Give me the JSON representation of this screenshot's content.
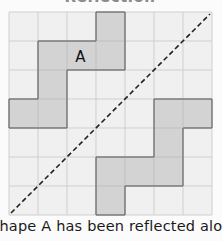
{
  "title": "Reflection",
  "grid": {
    "columns": 7,
    "rows": 7
  },
  "shape_a": {
    "label": "A",
    "cells": [
      [
        3,
        0
      ],
      [
        1,
        1
      ],
      [
        2,
        1
      ],
      [
        3,
        1
      ],
      [
        1,
        2
      ],
      [
        0,
        3
      ],
      [
        1,
        3
      ]
    ],
    "label_cell": [
      2,
      1
    ]
  },
  "shape_reflected": {
    "cells": [
      [
        5,
        3
      ],
      [
        6,
        3
      ],
      [
        5,
        4
      ],
      [
        3,
        5
      ],
      [
        4,
        5
      ],
      [
        5,
        5
      ],
      [
        3,
        6
      ]
    ]
  },
  "mirror_line": {
    "style": "dashed",
    "from_corner": "bottom-left",
    "to_corner": "top-right"
  },
  "caption": "Shape A has been reflected along the",
  "colors": {
    "grid_bg": "#f0f0f0",
    "grid_line": "#cfcfcf",
    "shape_fill": "#d3d3d3",
    "shape_stroke": "#6e6e6e",
    "mirror": "#222222"
  }
}
